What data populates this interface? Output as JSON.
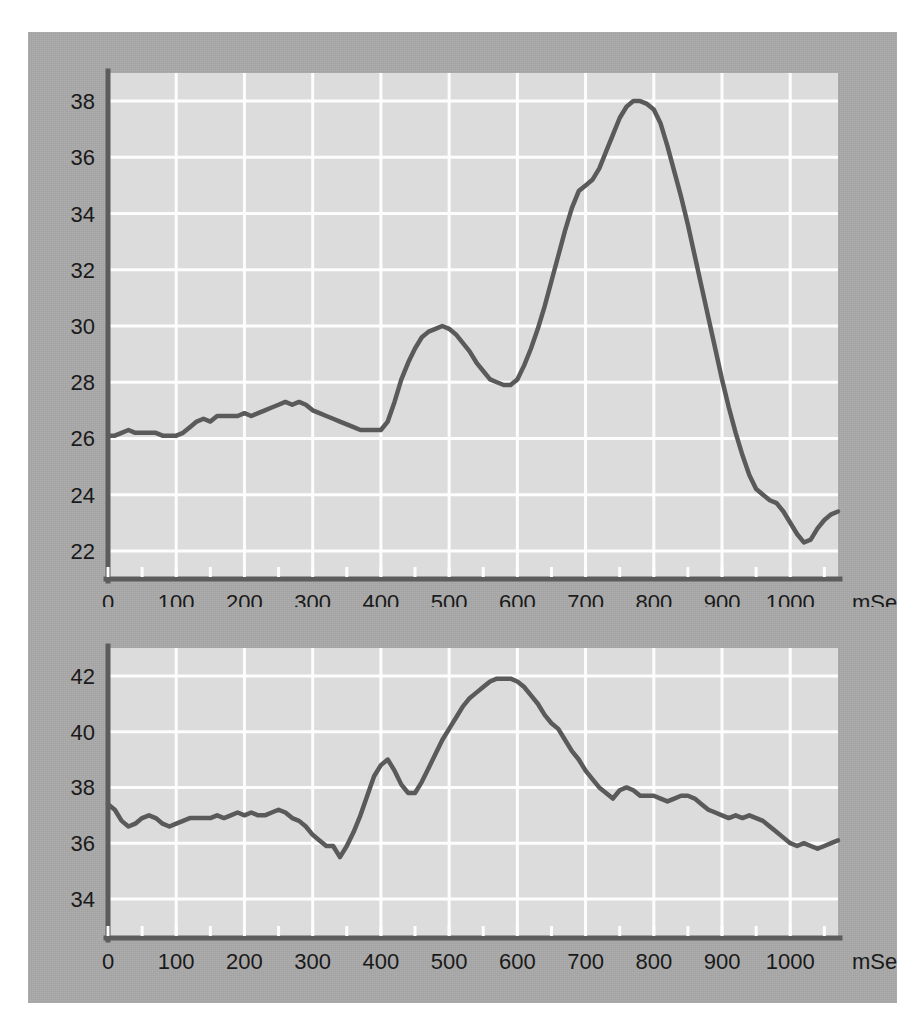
{
  "figure": {
    "background_color": "#ffffff",
    "panel_color": "#a8a8a8",
    "plot_background_color": "#dcdcdc",
    "grid_color": "#fdfdfd",
    "axis_color": "#5c5c5c",
    "line_color": "#5a5a5a"
  },
  "chart_data": [
    {
      "type": "line",
      "id": "top-chart",
      "title": "",
      "xlabel": "mSec",
      "ylabel": "",
      "xlim": [
        0,
        1070
      ],
      "ylim": [
        21.0,
        39.0
      ],
      "grid": true,
      "legend": "none",
      "xticks": [
        0,
        100,
        200,
        300,
        400,
        500,
        600,
        700,
        800,
        900,
        1000
      ],
      "xticklabels": [
        "0",
        "100",
        "200",
        "300",
        "400",
        "500",
        "600",
        "700",
        "800",
        "900",
        "1000"
      ],
      "xunit_label": "mSec",
      "yticks": [
        22,
        24,
        26,
        28,
        30,
        32,
        34,
        36,
        38
      ],
      "yticklabels": [
        "22",
        "24",
        "26",
        "28",
        "30",
        "32",
        "34",
        "36",
        "38"
      ],
      "x": [
        0,
        10,
        20,
        30,
        40,
        50,
        60,
        70,
        80,
        90,
        100,
        110,
        120,
        130,
        140,
        150,
        160,
        170,
        180,
        190,
        200,
        210,
        220,
        230,
        240,
        250,
        260,
        270,
        280,
        290,
        300,
        310,
        320,
        330,
        340,
        350,
        360,
        370,
        380,
        390,
        400,
        410,
        420,
        430,
        440,
        450,
        460,
        470,
        480,
        490,
        500,
        510,
        520,
        530,
        540,
        550,
        560,
        570,
        580,
        590,
        600,
        610,
        620,
        630,
        640,
        650,
        660,
        670,
        680,
        690,
        700,
        710,
        720,
        730,
        740,
        750,
        760,
        770,
        780,
        790,
        800,
        810,
        820,
        830,
        840,
        850,
        860,
        870,
        880,
        890,
        900,
        910,
        920,
        930,
        940,
        950,
        960,
        970,
        980,
        990,
        1000,
        1010,
        1020,
        1030,
        1040,
        1050,
        1060,
        1070
      ],
      "y": [
        26.1,
        26.1,
        26.2,
        26.3,
        26.2,
        26.2,
        26.2,
        26.2,
        26.1,
        26.1,
        26.1,
        26.2,
        26.4,
        26.6,
        26.7,
        26.6,
        26.8,
        26.8,
        26.8,
        26.8,
        26.9,
        26.8,
        26.9,
        27.0,
        27.1,
        27.2,
        27.3,
        27.2,
        27.3,
        27.2,
        27.0,
        26.9,
        26.8,
        26.7,
        26.6,
        26.5,
        26.4,
        26.3,
        26.3,
        26.3,
        26.3,
        26.6,
        27.3,
        28.1,
        28.7,
        29.2,
        29.6,
        29.8,
        29.9,
        30.0,
        29.9,
        29.7,
        29.4,
        29.1,
        28.7,
        28.4,
        28.1,
        28.0,
        27.9,
        27.9,
        28.1,
        28.6,
        29.2,
        29.9,
        30.7,
        31.6,
        32.5,
        33.4,
        34.2,
        34.8,
        35.0,
        35.2,
        35.6,
        36.2,
        36.8,
        37.4,
        37.8,
        38.0,
        38.0,
        37.9,
        37.7,
        37.2,
        36.4,
        35.5,
        34.6,
        33.6,
        32.5,
        31.4,
        30.3,
        29.2,
        28.1,
        27.1,
        26.2,
        25.4,
        24.7,
        24.2,
        24.0,
        23.8,
        23.7,
        23.4,
        23.0,
        22.6,
        22.3,
        22.4,
        22.8,
        23.1,
        23.3,
        23.4,
        23.5,
        23.4,
        23.5,
        23.8,
        24.1,
        24.3,
        24.4,
        24.3,
        24.4,
        24.2,
        23.9,
        23.6,
        23.4,
        23.3,
        23.2,
        23.2,
        23.3,
        23.4,
        23.6,
        23.9,
        24.2,
        24.5,
        24.7,
        24.9,
        24.8
      ]
    },
    {
      "type": "line",
      "id": "bottom-chart",
      "title": "",
      "xlabel": "mSec",
      "ylabel": "",
      "xlim": [
        0,
        1070
      ],
      "ylim": [
        32.6,
        43.0
      ],
      "grid": true,
      "legend": "none",
      "xticks": [
        0,
        100,
        200,
        300,
        400,
        500,
        600,
        700,
        800,
        900,
        1000
      ],
      "xticklabels": [
        "0",
        "100",
        "200",
        "300",
        "400",
        "500",
        "600",
        "700",
        "800",
        "900",
        "1000"
      ],
      "xunit_label": "mSec",
      "yticks": [
        34,
        36,
        38,
        40,
        42
      ],
      "yticklabels": [
        "34",
        "36",
        "38",
        "40",
        "42"
      ],
      "x": [
        0,
        10,
        20,
        30,
        40,
        50,
        60,
        70,
        80,
        90,
        100,
        110,
        120,
        130,
        140,
        150,
        160,
        170,
        180,
        190,
        200,
        210,
        220,
        230,
        240,
        250,
        260,
        270,
        280,
        290,
        300,
        310,
        320,
        330,
        340,
        350,
        360,
        370,
        380,
        390,
        400,
        410,
        420,
        430,
        440,
        450,
        460,
        470,
        480,
        490,
        500,
        510,
        520,
        530,
        540,
        550,
        560,
        570,
        580,
        590,
        600,
        610,
        620,
        630,
        640,
        650,
        660,
        670,
        680,
        690,
        700,
        710,
        720,
        730,
        740,
        750,
        760,
        770,
        780,
        790,
        800,
        810,
        820,
        830,
        840,
        850,
        860,
        870,
        880,
        890,
        900,
        910,
        920,
        930,
        940,
        950,
        960,
        970,
        980,
        990,
        1000,
        1010,
        1020,
        1030,
        1040,
        1050,
        1060,
        1070
      ],
      "y": [
        37.4,
        37.2,
        36.8,
        36.6,
        36.7,
        36.9,
        37.0,
        36.9,
        36.7,
        36.6,
        36.7,
        36.8,
        36.9,
        36.9,
        36.9,
        36.9,
        37.0,
        36.9,
        37.0,
        37.1,
        37.0,
        37.1,
        37.0,
        37.0,
        37.1,
        37.2,
        37.1,
        36.9,
        36.8,
        36.6,
        36.3,
        36.1,
        35.9,
        35.9,
        35.5,
        35.9,
        36.4,
        37.0,
        37.7,
        38.4,
        38.8,
        39.0,
        38.6,
        38.1,
        37.8,
        37.8,
        38.2,
        38.7,
        39.2,
        39.7,
        40.1,
        40.5,
        40.9,
        41.2,
        41.4,
        41.6,
        41.8,
        41.9,
        41.9,
        41.9,
        41.8,
        41.6,
        41.3,
        41.0,
        40.6,
        40.3,
        40.1,
        39.7,
        39.3,
        39.0,
        38.6,
        38.3,
        38.0,
        37.8,
        37.6,
        37.9,
        38.0,
        37.9,
        37.7,
        37.7,
        37.7,
        37.6,
        37.5,
        37.6,
        37.7,
        37.7,
        37.6,
        37.4,
        37.2,
        37.1,
        37.0,
        36.9,
        37.0,
        36.9,
        37.0,
        36.9,
        36.8,
        36.6,
        36.4,
        36.2,
        36.0,
        35.9,
        36.0,
        35.9,
        35.8,
        35.9,
        36.0,
        36.1
      ]
    }
  ]
}
